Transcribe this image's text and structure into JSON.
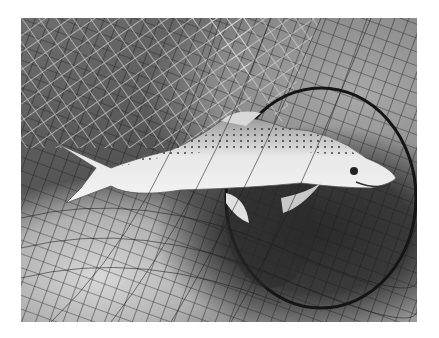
{
  "image": {
    "subject": "trout in landing net",
    "alt": "Black-and-white photograph of a spotted brown trout lying in a fishing landing net",
    "colors": {
      "background": "#ffffff",
      "fish_body": "#e6e6e6",
      "net_dark": "#1e1e1e",
      "net_light": "#f0f0f0"
    }
  }
}
